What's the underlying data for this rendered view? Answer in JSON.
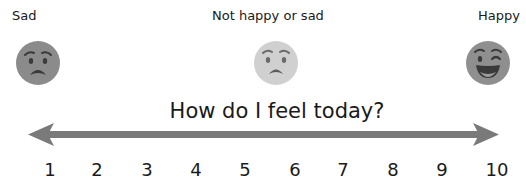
{
  "labels": {
    "left": "Sad",
    "middle": "Not happy or sad",
    "right": "Happy"
  },
  "faces": [
    {
      "name": "sad-face",
      "expression": "worried",
      "color": "#8a8a8a"
    },
    {
      "name": "neutral-face",
      "expression": "worried-light",
      "color": "#cfcfcf"
    },
    {
      "name": "happy-face",
      "expression": "winking-grin",
      "color": "#8f8f8f"
    }
  ],
  "title": "How do I feel today?",
  "scale": {
    "numbers": [
      "1",
      "2",
      "3",
      "4",
      "5",
      "6",
      "7",
      "8",
      "9",
      "10"
    ],
    "arrow_color": "#7a7a7a"
  }
}
